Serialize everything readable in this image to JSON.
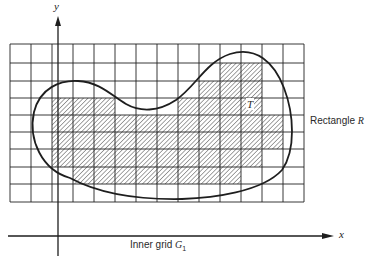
{
  "diagram": {
    "axes": {
      "x_label": "x",
      "y_label": "y"
    },
    "labels": {
      "rectangle_text": "Rectangle",
      "rectangle_symbol": "R",
      "inner_grid_text": "Inner grid",
      "inner_grid_symbol": "G",
      "inner_grid_subscript": "1",
      "region_symbol": "T"
    },
    "grid": {
      "left": 10,
      "top": 44,
      "col_edges": [
        10,
        31,
        52,
        73,
        94,
        115,
        136,
        157,
        178,
        199,
        220,
        241,
        262,
        283,
        304
      ],
      "row_edges": [
        44,
        63,
        81,
        98,
        115,
        132,
        149,
        167,
        184,
        202
      ],
      "columns": 14,
      "rows": 9
    },
    "shaded_cells": [
      {
        "row": 1,
        "cols": [
          10,
          11
        ]
      },
      {
        "row": 2,
        "cols": [
          9,
          10,
          11
        ]
      },
      {
        "row": 3,
        "cols": [
          2,
          3,
          4,
          8,
          9,
          10,
          11
        ]
      },
      {
        "row": 4,
        "cols": [
          2,
          3,
          4,
          5,
          6,
          7,
          8,
          9,
          10,
          11,
          12
        ]
      },
      {
        "row": 5,
        "cols": [
          2,
          3,
          4,
          5,
          6,
          7,
          8,
          9,
          10,
          11,
          12
        ]
      },
      {
        "row": 6,
        "cols": [
          2,
          3,
          4,
          5,
          6,
          7,
          8,
          9,
          10,
          11
        ]
      },
      {
        "row": 7,
        "cols": [
          3,
          4,
          5,
          6,
          7,
          8,
          9,
          10
        ]
      }
    ],
    "colors": {
      "ink": "#222222",
      "background": "#ffffff"
    }
  }
}
